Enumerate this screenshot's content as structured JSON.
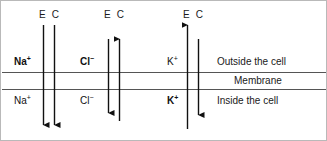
{
  "figure": {
    "background_color": "#ffffff",
    "border_color": "#b9b9b9",
    "line_color": "#111111",
    "membrane_line_color": "#555555"
  },
  "column_headers": [
    {
      "id": "ec-na",
      "text": "E C"
    },
    {
      "id": "ec-cl",
      "text": "E C"
    },
    {
      "id": "ec-k",
      "text": "E C"
    }
  ],
  "ions": [
    {
      "id": "sodium",
      "symbol": "Na",
      "charge": "+",
      "outside_label": "Na",
      "outside_charge": "+",
      "outside_bold": true,
      "inside_label": "Na",
      "inside_charge": "+",
      "inside_bold": false,
      "arrows": [
        {
          "name": "electrical",
          "letter": "E",
          "direction": "down"
        },
        {
          "name": "chemical",
          "letter": "C",
          "direction": "down"
        }
      ]
    },
    {
      "id": "chloride",
      "symbol": "Cl",
      "charge": "−",
      "outside_label": "Cl",
      "outside_charge": "−",
      "outside_bold": true,
      "inside_label": "Cl",
      "inside_charge": "−",
      "inside_bold": false,
      "arrows": [
        {
          "name": "electrical",
          "letter": "E",
          "direction": "down"
        },
        {
          "name": "chemical",
          "letter": "C",
          "direction": "up"
        }
      ]
    },
    {
      "id": "potassium",
      "symbol": "K",
      "charge": "+",
      "outside_label": "K",
      "outside_charge": "+",
      "outside_bold": false,
      "inside_label": "K",
      "inside_charge": "+",
      "inside_bold": true,
      "arrows": [
        {
          "name": "electrical",
          "letter": "E",
          "direction": "up"
        },
        {
          "name": "chemical",
          "letter": "C",
          "direction": "down"
        }
      ]
    }
  ],
  "regions": {
    "outside": "Outside the cell",
    "membrane": "Membrane",
    "inside": "Inside the cell"
  },
  "legend": {
    "E": "Electrical gradient",
    "C": "Chemical gradient"
  }
}
